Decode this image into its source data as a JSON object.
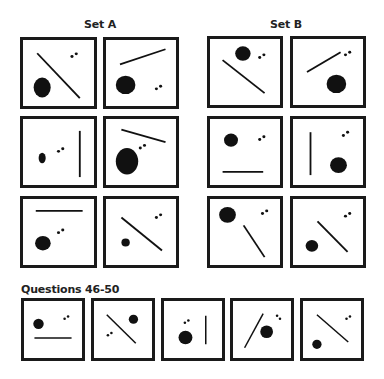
{
  "titles": {
    "set_a": "Set A",
    "set_b": "Set B",
    "questions": "Questions 46-50"
  },
  "colors": {
    "ink": "#111111",
    "border": "#1a1a1a",
    "background": "#ffffff"
  },
  "panels": [
    {
      "id": "set-a-1",
      "box": [
        20,
        37,
        77,
        72
      ],
      "shapes": [
        {
          "t": "line",
          "x1": 20,
          "y1": 20,
          "x2": 80,
          "y2": 88
        },
        {
          "t": "ellipse",
          "cx": 27,
          "cy": 72,
          "rx": 12,
          "ry": 15
        },
        {
          "t": "dot",
          "cx": 69,
          "cy": 25
        },
        {
          "t": "dot",
          "cx": 75,
          "cy": 21
        }
      ]
    },
    {
      "id": "set-a-2",
      "box": [
        103,
        37,
        76,
        72
      ],
      "shapes": [
        {
          "t": "line",
          "x1": 20,
          "y1": 37,
          "x2": 85,
          "y2": 14
        },
        {
          "t": "ellipse",
          "cx": 28,
          "cy": 68,
          "rx": 14,
          "ry": 14
        },
        {
          "t": "dot",
          "cx": 72,
          "cy": 74
        },
        {
          "t": "dot",
          "cx": 78,
          "cy": 70
        }
      ]
    },
    {
      "id": "set-b-1",
      "box": [
        207,
        36,
        76,
        72
      ],
      "shapes": [
        {
          "t": "line",
          "x1": 18,
          "y1": 32,
          "x2": 78,
          "y2": 82
        },
        {
          "t": "ellipse",
          "cx": 47,
          "cy": 22,
          "rx": 11,
          "ry": 11
        },
        {
          "t": "dot",
          "cx": 71,
          "cy": 28
        },
        {
          "t": "dot",
          "cx": 77,
          "cy": 24
        }
      ]
    },
    {
      "id": "set-b-2",
      "box": [
        290,
        36,
        76,
        72
      ],
      "shapes": [
        {
          "t": "line",
          "x1": 20,
          "y1": 50,
          "x2": 68,
          "y2": 20
        },
        {
          "t": "ellipse",
          "cx": 62,
          "cy": 68,
          "rx": 14,
          "ry": 14
        },
        {
          "t": "dot",
          "cx": 75,
          "cy": 24
        },
        {
          "t": "dot",
          "cx": 81,
          "cy": 20
        }
      ]
    },
    {
      "id": "set-a-3",
      "box": [
        20,
        116,
        77,
        72
      ],
      "shapes": [
        {
          "t": "line",
          "x1": 80,
          "y1": 18,
          "x2": 80,
          "y2": 88
        },
        {
          "t": "ellipse",
          "cx": 27,
          "cy": 59,
          "rx": 5,
          "ry": 8
        },
        {
          "t": "dot",
          "cx": 50,
          "cy": 49
        },
        {
          "t": "dot",
          "cx": 56,
          "cy": 45
        }
      ]
    },
    {
      "id": "set-a-4",
      "box": [
        103,
        116,
        76,
        72
      ],
      "shapes": [
        {
          "t": "line",
          "x1": 22,
          "y1": 16,
          "x2": 85,
          "y2": 35
        },
        {
          "t": "ellipse",
          "cx": 30,
          "cy": 64,
          "rx": 16,
          "ry": 20
        },
        {
          "t": "dot",
          "cx": 49,
          "cy": 44
        },
        {
          "t": "dot",
          "cx": 55,
          "cy": 40
        }
      ]
    },
    {
      "id": "set-b-3",
      "box": [
        207,
        116,
        76,
        72
      ],
      "shapes": [
        {
          "t": "line",
          "x1": 18,
          "y1": 80,
          "x2": 76,
          "y2": 80
        },
        {
          "t": "ellipse",
          "cx": 30,
          "cy": 32,
          "rx": 10,
          "ry": 10
        },
        {
          "t": "dot",
          "cx": 71,
          "cy": 31
        },
        {
          "t": "dot",
          "cx": 77,
          "cy": 27
        }
      ]
    },
    {
      "id": "set-b-4",
      "box": [
        290,
        116,
        76,
        72
      ],
      "shapes": [
        {
          "t": "line",
          "x1": 25,
          "y1": 20,
          "x2": 25,
          "y2": 85
        },
        {
          "t": "ellipse",
          "cx": 65,
          "cy": 70,
          "rx": 12,
          "ry": 12
        },
        {
          "t": "dot",
          "cx": 72,
          "cy": 25
        },
        {
          "t": "dot",
          "cx": 78,
          "cy": 20
        }
      ]
    },
    {
      "id": "set-a-5",
      "box": [
        20,
        196,
        77,
        72
      ],
      "shapes": [
        {
          "t": "line",
          "x1": 18,
          "y1": 18,
          "x2": 84,
          "y2": 18
        },
        {
          "t": "ellipse",
          "cx": 28,
          "cy": 67,
          "rx": 11,
          "ry": 11
        },
        {
          "t": "dot",
          "cx": 50,
          "cy": 51
        },
        {
          "t": "dot",
          "cx": 56,
          "cy": 47
        }
      ]
    },
    {
      "id": "set-a-6",
      "box": [
        103,
        196,
        76,
        72
      ],
      "shapes": [
        {
          "t": "line",
          "x1": 22,
          "y1": 28,
          "x2": 80,
          "y2": 78
        },
        {
          "t": "ellipse",
          "cx": 28,
          "cy": 66,
          "rx": 6,
          "ry": 6
        },
        {
          "t": "dot",
          "cx": 72,
          "cy": 28
        },
        {
          "t": "dot",
          "cx": 78,
          "cy": 24
        }
      ]
    },
    {
      "id": "set-b-5",
      "box": [
        207,
        196,
        76,
        72
      ],
      "shapes": [
        {
          "t": "line",
          "x1": 48,
          "y1": 40,
          "x2": 78,
          "y2": 88
        },
        {
          "t": "ellipse",
          "cx": 25,
          "cy": 24,
          "rx": 12,
          "ry": 12
        },
        {
          "t": "dot",
          "cx": 75,
          "cy": 22
        },
        {
          "t": "dot",
          "cx": 81,
          "cy": 18
        }
      ]
    },
    {
      "id": "set-b-6",
      "box": [
        290,
        196,
        76,
        72
      ],
      "shapes": [
        {
          "t": "line",
          "x1": 35,
          "y1": 34,
          "x2": 78,
          "y2": 80
        },
        {
          "t": "ellipse",
          "cx": 27,
          "cy": 71,
          "rx": 9,
          "ry": 9
        },
        {
          "t": "dot",
          "cx": 75,
          "cy": 26
        },
        {
          "t": "dot",
          "cx": 81,
          "cy": 22
        }
      ]
    },
    {
      "id": "question-46",
      "box": [
        21,
        298,
        64,
        63
      ],
      "shapes": [
        {
          "t": "line",
          "x1": 18,
          "y1": 65,
          "x2": 82,
          "y2": 65
        },
        {
          "t": "ellipse",
          "cx": 25,
          "cy": 40,
          "rx": 9,
          "ry": 9
        },
        {
          "t": "dot",
          "cx": 70,
          "cy": 31
        },
        {
          "t": "dot",
          "cx": 76,
          "cy": 27
        }
      ]
    },
    {
      "id": "question-47",
      "box": [
        91,
        298,
        64,
        63
      ],
      "shapes": [
        {
          "t": "line",
          "x1": 22,
          "y1": 24,
          "x2": 72,
          "y2": 74
        },
        {
          "t": "ellipse",
          "cx": 68,
          "cy": 32,
          "rx": 8,
          "ry": 8
        },
        {
          "t": "dot",
          "cx": 24,
          "cy": 60
        },
        {
          "t": "dot",
          "cx": 30,
          "cy": 56
        }
      ]
    },
    {
      "id": "question-48",
      "box": [
        161,
        298,
        64,
        63
      ],
      "shapes": [
        {
          "t": "line",
          "x1": 72,
          "y1": 26,
          "x2": 72,
          "y2": 76
        },
        {
          "t": "ellipse",
          "cx": 37,
          "cy": 64,
          "rx": 12,
          "ry": 12
        },
        {
          "t": "dot",
          "cx": 36,
          "cy": 38
        },
        {
          "t": "dot",
          "cx": 42,
          "cy": 34
        }
      ]
    },
    {
      "id": "question-49",
      "box": [
        230,
        298,
        64,
        63
      ],
      "shapes": [
        {
          "t": "line",
          "x1": 20,
          "y1": 82,
          "x2": 52,
          "y2": 22
        },
        {
          "t": "ellipse",
          "cx": 58,
          "cy": 54,
          "rx": 11,
          "ry": 11
        },
        {
          "t": "dot",
          "cx": 76,
          "cy": 26
        },
        {
          "t": "dot",
          "cx": 81,
          "cy": 31
        }
      ]
    },
    {
      "id": "question-50",
      "box": [
        300,
        298,
        64,
        63
      ],
      "shapes": [
        {
          "t": "line",
          "x1": 24,
          "y1": 24,
          "x2": 78,
          "y2": 72
        },
        {
          "t": "ellipse",
          "cx": 24,
          "cy": 76,
          "rx": 8,
          "ry": 8
        },
        {
          "t": "dot",
          "cx": 75,
          "cy": 31
        },
        {
          "t": "dot",
          "cx": 81,
          "cy": 27
        }
      ]
    }
  ]
}
